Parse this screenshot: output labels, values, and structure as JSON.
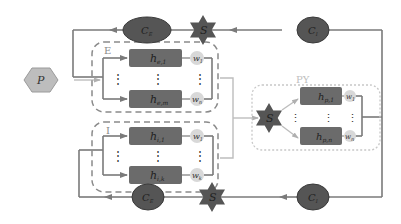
{
  "diagram": {
    "groups": {
      "E": {
        "label": "E",
        "units": [
          {
            "name": "h",
            "sub": "e,1"
          },
          {
            "name": "h",
            "sub": "e,m"
          }
        ],
        "weights": [
          {
            "name": "w",
            "sub": "1"
          },
          {
            "name": "w",
            "sub": "n"
          }
        ]
      },
      "I": {
        "label": "I",
        "units": [
          {
            "name": "h",
            "sub": "i,1"
          },
          {
            "name": "h",
            "sub": "i,k"
          }
        ],
        "weights": [
          {
            "name": "w",
            "sub": "1"
          },
          {
            "name": "w",
            "sub": "k"
          }
        ]
      },
      "PY": {
        "label": "PY",
        "units": [
          {
            "name": "h",
            "sub": "p,1"
          },
          {
            "name": "h",
            "sub": "p,n"
          }
        ],
        "weights": [
          {
            "name": "w",
            "sub": "1"
          },
          {
            "name": "w",
            "sub": "n"
          }
        ]
      }
    },
    "input": {
      "label": "P"
    },
    "stars": {
      "top": "S",
      "bottom": "S",
      "py": "S"
    },
    "ellipses": {
      "top_left": {
        "name": "C",
        "sub": "E"
      },
      "top_right": {
        "name": "C",
        "sub": "I"
      },
      "bottom_left": {
        "name": "C",
        "sub": "E"
      },
      "bottom_right": {
        "name": "C",
        "sub": "I"
      }
    },
    "ellipsis_dots": "⋮",
    "colors": {
      "line": "#7a7a7a",
      "dark_fill": "#5a5a5a",
      "unit_fill": "#6b6b6b",
      "weight_fill": "#d8d8d8",
      "hex_fill": "#bdbdbd",
      "dashed": "#8a8a8a",
      "dotted": "#c8c8c8"
    }
  }
}
